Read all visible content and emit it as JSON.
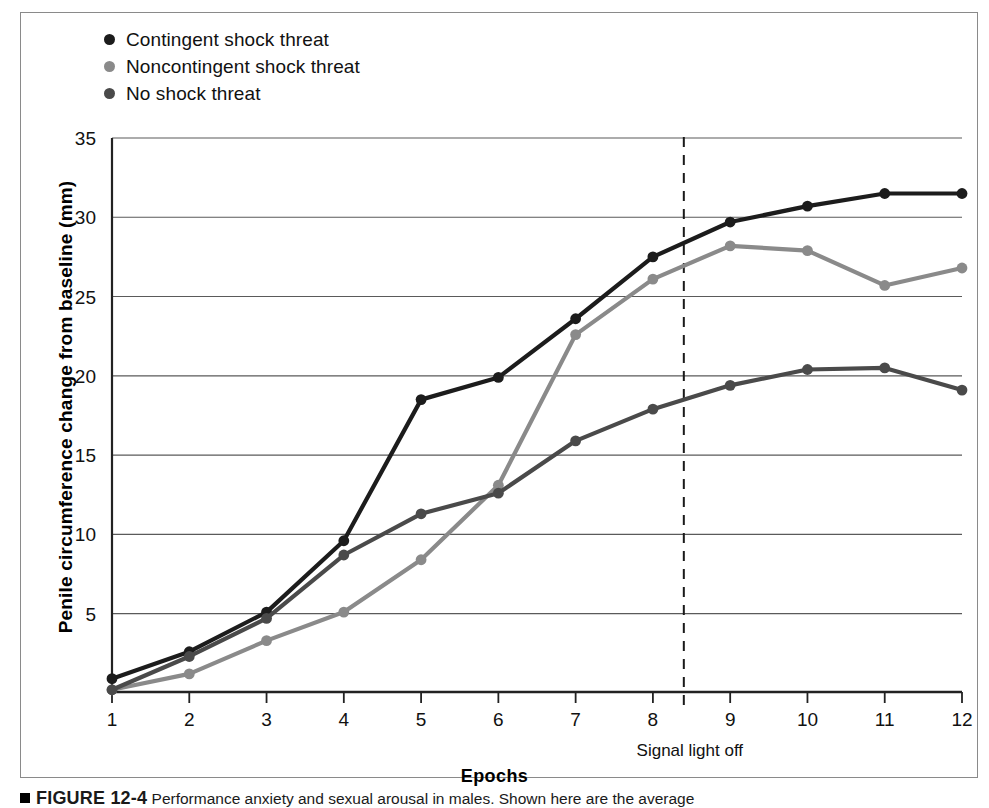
{
  "figure": {
    "caption_marker": "square-bullet",
    "caption_number": "FIGURE 12-4",
    "caption_text": "Performance anxiety and sexual arousal in males. Shown here are the average"
  },
  "legend": {
    "position": "top-left",
    "items": [
      {
        "label": "Contingent shock threat",
        "color": "#1c1c1c",
        "marker": "circle"
      },
      {
        "label": "Noncontingent shock threat",
        "color": "#8a8a8a",
        "marker": "circle"
      },
      {
        "label": "No shock threat",
        "color": "#4a4a4a",
        "marker": "circle"
      }
    ]
  },
  "axes": {
    "ylabel": "Penile circumference change from baseline (mm)",
    "xlabel": "Epochs",
    "y_ticks": [
      "5",
      "10",
      "15",
      "20",
      "25",
      "30",
      "35"
    ],
    "x_ticks": [
      "1",
      "2",
      "3",
      "4",
      "5",
      "6",
      "7",
      "8",
      "9",
      "10",
      "11",
      "12"
    ]
  },
  "annotations": [
    {
      "label": "Signal light off",
      "x": 8.4,
      "style": "dashed-vertical"
    }
  ],
  "chart_data": {
    "type": "line",
    "title": "",
    "subtitle": "",
    "xlabel": "Epochs",
    "ylabel": "Penile circumference change from baseline (mm)",
    "x": [
      1,
      2,
      3,
      4,
      5,
      6,
      7,
      8,
      9,
      10,
      11,
      12
    ],
    "xlim": [
      1,
      12
    ],
    "ylim": [
      0,
      35
    ],
    "y_ticks": [
      5,
      10,
      15,
      20,
      25,
      30,
      35
    ],
    "grid": "horizontal",
    "legend_position": "top-left",
    "annotations": [
      {
        "text": "Signal light off",
        "x": 8.4,
        "type": "vertical-dashed-line"
      }
    ],
    "series": [
      {
        "name": "Contingent shock threat",
        "color": "#1c1c1c",
        "values": [
          0.9,
          2.6,
          5.1,
          9.6,
          18.5,
          19.9,
          23.6,
          27.5,
          29.7,
          30.7,
          31.5,
          31.5
        ]
      },
      {
        "name": "Noncontingent shock threat",
        "color": "#8a8a8a",
        "values": [
          0.2,
          1.2,
          3.3,
          5.1,
          8.4,
          13.1,
          22.6,
          26.1,
          28.2,
          27.9,
          25.7,
          26.8
        ]
      },
      {
        "name": "No shock threat",
        "color": "#4a4a4a",
        "values": [
          0.2,
          2.3,
          4.7,
          8.7,
          11.3,
          12.6,
          15.9,
          17.9,
          19.4,
          20.4,
          20.5,
          19.1
        ]
      }
    ]
  },
  "plot_geometry": {
    "left": 112,
    "right": 962,
    "baseline_y": 692,
    "top_y": 138,
    "y_value_at_top": 35,
    "y_value_at_baseline": 0.06
  }
}
